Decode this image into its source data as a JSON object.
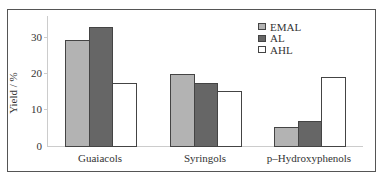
{
  "chart_data": {
    "type": "bar",
    "title": "",
    "xlabel": "",
    "ylabel": "Yield / %",
    "ylim": [
      0,
      35
    ],
    "yticks": [
      "0",
      "10",
      "20",
      "30"
    ],
    "categories": [
      "Guaiacols",
      "Syringols",
      "p–Hydroxyphenols"
    ],
    "series": [
      {
        "name": "EMAL",
        "color": "#b3b3b3",
        "values": [
          29.6,
          20.3,
          5.4
        ]
      },
      {
        "name": "AL",
        "color": "#666666",
        "values": [
          33.3,
          17.8,
          7.2
        ]
      },
      {
        "name": "AHL",
        "color": "#ffffff",
        "values": [
          17.6,
          15.6,
          19.4
        ]
      }
    ],
    "legend_position": "upper right",
    "grid": false
  }
}
